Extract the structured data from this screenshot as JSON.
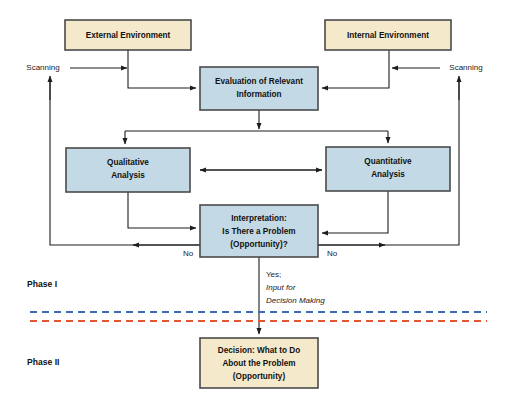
{
  "diagram": {
    "colors": {
      "environment_box_fill": "#f5e9cc",
      "analysis_box_fill": "#c3dae6",
      "box_border": "#4a4a4a",
      "line": "#1d1d1d",
      "phase_divider_blue": "#3b6fb0",
      "phase_divider_red": "#e0562f",
      "background": "#ffffff"
    },
    "nodes": [
      {
        "id": "external-environment",
        "lines": [
          "External Environment"
        ],
        "fill": "#f5e9cc",
        "x": 65,
        "y": 20,
        "w": 126,
        "h": 30
      },
      {
        "id": "internal-environment",
        "lines": [
          "Internal Environment"
        ],
        "fill": "#f5e9cc",
        "x": 325,
        "y": 20,
        "w": 126,
        "h": 30
      },
      {
        "id": "evaluation-of-relevant-information",
        "lines": [
          "Evaluation of Relevant",
          "Information"
        ],
        "fill": "#c3dae6",
        "x": 200,
        "y": 67,
        "w": 118,
        "h": 43
      },
      {
        "id": "qualitative-analysis",
        "lines": [
          "Qualitative",
          "Analysis"
        ],
        "fill": "#c3dae6",
        "x": 66,
        "y": 148,
        "w": 124,
        "h": 44
      },
      {
        "id": "quantitative-analysis",
        "lines": [
          "Quantitative",
          "Analysis"
        ],
        "fill": "#c3dae6",
        "x": 326,
        "y": 147,
        "w": 124,
        "h": 44
      },
      {
        "id": "interpretation",
        "lines": [
          "Interpretation:",
          "Is There a Problem",
          "(Opportunity)?"
        ],
        "fill": "#c3dae6",
        "x": 200,
        "y": 205,
        "w": 118,
        "h": 52
      },
      {
        "id": "decision",
        "lines": [
          "Decision: What to Do",
          "About the Problem",
          "(Opportunity)"
        ],
        "fill": "#f5e9cc",
        "x": 200,
        "y": 338,
        "w": 118,
        "h": 50
      }
    ],
    "edge_labels": {
      "scanning_left": "Scanning",
      "scanning_right": "Scanning",
      "no_left": "No",
      "no_right": "No",
      "yes_line1": "Yes;",
      "yes_line2": "Input for",
      "yes_line3": "Decision Making"
    },
    "phases": {
      "phase_one": "Phase I",
      "phase_two": "Phase II"
    }
  }
}
